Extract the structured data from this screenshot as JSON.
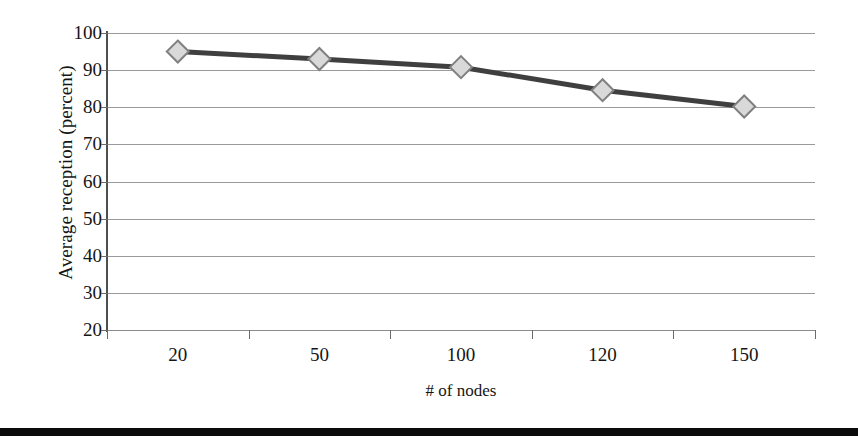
{
  "chart_data": {
    "type": "line",
    "title": "",
    "xlabel": "# of nodes",
    "ylabel": "Average reception (percent)",
    "categories": [
      "20",
      "50",
      "100",
      "120",
      "150"
    ],
    "values": [
      95,
      93,
      90.8,
      84.6,
      80.2
    ],
    "series": [
      {
        "name": "Average reception",
        "values": [
          95,
          93,
          90.8,
          84.6,
          80.2
        ],
        "marker": "diamond",
        "marker_fill": "#d9d9d9",
        "marker_stroke": "#808080",
        "line_color": "#3f3f3f"
      }
    ],
    "ylim": [
      20,
      100
    ],
    "yticks": [
      20,
      30,
      40,
      50,
      60,
      70,
      80,
      90,
      100
    ],
    "ytick_labels": [
      "20",
      "30",
      "40",
      "50",
      "60",
      "70",
      "80",
      "90",
      "100"
    ],
    "xtick_labels": [
      "20",
      "50",
      "100",
      "120",
      "150"
    ],
    "grid": "horizontal",
    "legend": "none",
    "gridline_color": "#9a9a9a",
    "axis_color": "#4f4f4f",
    "background": "#ffffff"
  },
  "figure": {
    "bottom_rule_color": "#0b0b0b"
  }
}
